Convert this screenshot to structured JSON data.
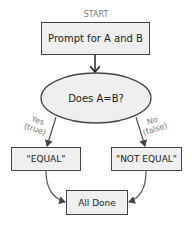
{
  "diagram": {
    "type": "flowchart",
    "start_label": "START",
    "nodes": {
      "prompt": {
        "label": "Prompt for A and B",
        "shape": "rectangle"
      },
      "decision": {
        "label": "Does A=B?",
        "shape": "ellipse"
      },
      "equal": {
        "label": "\"EQUAL\"",
        "shape": "rectangle"
      },
      "not_equal": {
        "label": "\"NOT EQUAL\"",
        "shape": "rectangle"
      },
      "done": {
        "label": "All Done",
        "shape": "rectangle"
      }
    },
    "edges": {
      "yes": {
        "line1": "Yes",
        "line2": "(true)"
      },
      "no": {
        "line1": "No",
        "line2": "(false)"
      }
    },
    "colors": {
      "fill": "#efefef",
      "stroke": "#444444",
      "edge": "#555555",
      "label_gray": "#777777"
    }
  }
}
